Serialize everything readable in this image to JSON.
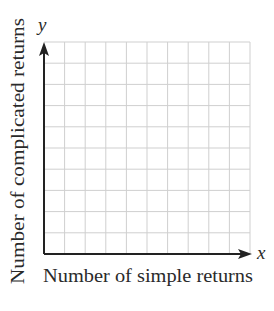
{
  "chart_data": {
    "type": "scatter",
    "title": "",
    "xlabel": "Number of simple returns",
    "ylabel": "Number of complicated returns",
    "x_axis_var": "x",
    "y_axis_var": "y",
    "grid": true,
    "grid_columns": 10,
    "grid_rows": 10,
    "x_ticks": [],
    "y_ticks": [],
    "series": [],
    "legend": null,
    "colors": {
      "axis": "#222222",
      "grid": "#cfcfcf",
      "text": "#2a2a2a"
    }
  }
}
